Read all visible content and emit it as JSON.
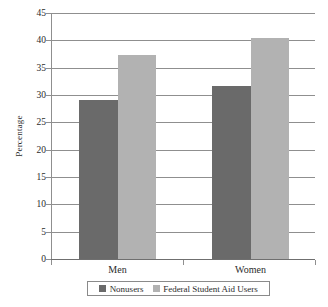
{
  "chart_data": {
    "type": "bar",
    "title": "",
    "subtitle": "",
    "xlabel": "",
    "ylabel": "Percentage",
    "categories": [
      "Men",
      "Women"
    ],
    "series": [
      {
        "name": "Nonusers",
        "values": [
          29.0,
          31.7
        ],
        "color": "#6a6a6a"
      },
      {
        "name": "Federal Student Aid Users",
        "values": [
          37.4,
          40.5
        ],
        "color": "#b2b2b2"
      }
    ],
    "ylim": [
      0,
      45
    ],
    "ytick_step": 5,
    "yticks": [
      0,
      5,
      10,
      15,
      20,
      25,
      30,
      35,
      40,
      45
    ],
    "ytick_labels": [
      "0",
      "5",
      "10",
      "15",
      "20",
      "25",
      "30",
      "35",
      "40",
      "45"
    ],
    "grid": true,
    "grid_axis": "y",
    "legend_position": "bottom",
    "legend_border": true,
    "axis_color": "#8f8f8f",
    "background": "#ffffff",
    "text_color": "#2b2b2b"
  }
}
